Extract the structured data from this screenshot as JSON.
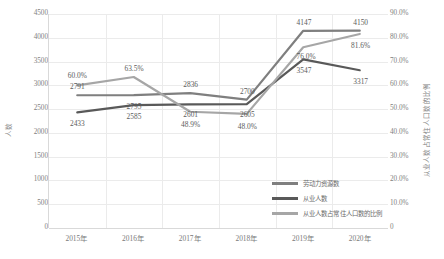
{
  "chart_data": {
    "type": "line",
    "title": "",
    "categories": [
      "2015年",
      "2016年",
      "2017年",
      "2018年",
      "2019年",
      "2020年"
    ],
    "xlabel": "",
    "ylabel": "人数",
    "y2label": "从业人数占常住人口数的比例",
    "ylim": [
      0,
      4500
    ],
    "y2lim": [
      0,
      0.9
    ],
    "grid": true,
    "legend_position": "inside-bottom-right",
    "y_ticks": [
      "0",
      "500",
      "1000",
      "1500",
      "2000",
      "2500",
      "3000",
      "3500",
      "4000",
      "4500"
    ],
    "y_tick_values": [
      0,
      500,
      1000,
      1500,
      2000,
      2500,
      3000,
      3500,
      4000,
      4500
    ],
    "y2_ticks": [
      "0",
      "10.0%",
      "20.0%",
      "30.0%",
      "40.0%",
      "50.0%",
      "60.0%",
      "70.0%",
      "80.0%",
      "90.0%"
    ],
    "y2_tick_values": [
      0,
      0.1,
      0.2,
      0.3,
      0.4,
      0.5,
      0.6,
      0.7,
      0.8,
      0.9
    ],
    "series": [
      {
        "name": "劳动力资源数",
        "axis": "left",
        "color": "#7f7f7f",
        "values": [
          2791,
          2795,
          2836,
          2700,
          4147,
          4150
        ],
        "labels": [
          "2791",
          "2795",
          "2836",
          "2700",
          "4147",
          "4150"
        ]
      },
      {
        "name": "从业人数",
        "axis": "left",
        "color": "#595959",
        "values": [
          2433,
          2585,
          2601,
          2605,
          3547,
          3317
        ],
        "labels": [
          "2433",
          "2585",
          "2601",
          "2605",
          "3547",
          "3317"
        ]
      },
      {
        "name": "从业人数占常住人口数的比例",
        "axis": "right",
        "color": "#a6a6a6",
        "values": [
          0.6,
          0.635,
          0.489,
          0.48,
          0.76,
          0.816
        ],
        "labels": [
          "60.0%",
          "63.5%",
          "48.9%",
          "48.0%",
          "76.0%",
          "81.6%"
        ]
      }
    ]
  },
  "legend": {
    "items": [
      {
        "label": "劳动力资源数",
        "color": "#7f7f7f"
      },
      {
        "label": "从业人数",
        "color": "#595959"
      },
      {
        "label": "从业人数占常住人口数的比例",
        "color": "#a6a6a6"
      }
    ]
  },
  "axes": {
    "left_title": "人数",
    "right_title": "从业人数占常住人口数的比例"
  }
}
